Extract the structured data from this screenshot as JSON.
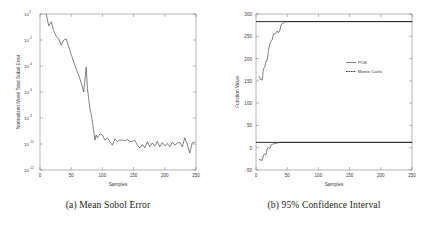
{
  "figure": {
    "subfigures": [
      {
        "id": "a",
        "caption": "(a) Mean Sobol Error"
      },
      {
        "id": "b",
        "caption": "(b) 95% Confidence Interval"
      }
    ]
  },
  "chart_data": [
    {
      "type": "line",
      "title": "",
      "caption": "(a) Mean Sobol Error",
      "xlabel": "Samples",
      "ylabel": "Normalized Mean Total Sobol Error",
      "xlim": [
        0,
        250
      ],
      "ylim": [
        1e-12,
        1
      ],
      "yscale": "log",
      "grid": false,
      "legend": null,
      "xticks": [
        0,
        50,
        100,
        150,
        200,
        250
      ],
      "xticklabels": [
        "0",
        "50",
        "100",
        "150",
        "200",
        "250"
      ],
      "yticks": [
        1,
        0.01,
        0.0001,
        1e-06,
        1e-08,
        1e-10,
        1e-12
      ],
      "yticklabels": [
        "10^0",
        "10^-2",
        "10^-4",
        "10^-6",
        "10^-8",
        "10^-10",
        "10^-12"
      ],
      "series": [
        {
          "name": "Normalized Mean Total Sobol Error",
          "x": [
            10,
            14,
            18,
            22,
            26,
            30,
            34,
            38,
            42,
            46,
            50,
            54,
            58,
            62,
            66,
            70,
            74,
            76,
            78,
            80,
            82,
            84,
            86,
            88,
            90,
            92,
            96,
            100,
            104,
            108,
            112,
            116,
            120,
            124,
            128,
            132,
            136,
            140,
            144,
            148,
            152,
            156,
            160,
            164,
            168,
            172,
            176,
            180,
            184,
            188,
            192,
            196,
            200,
            204,
            208,
            212,
            216,
            220,
            224,
            228,
            232,
            236,
            240,
            244,
            248
          ],
          "y": [
            1.0,
            0.12,
            0.25,
            0.05,
            0.02,
            0.012,
            0.004,
            0.01,
            0.012,
            0.003,
            0.0008,
            0.0002,
            6e-05,
            2e-05,
            5e-06,
            1e-06,
            8e-05,
            2e-06,
            3e-07,
            5e-08,
            2e-08,
            5e-09,
            1e-09,
            2e-10,
            5e-10,
            3e-10,
            6e-10,
            5e-10,
            2e-10,
            3e-10,
            1.5e-10,
            8e-11,
            2.5e-10,
            1.5e-10,
            2e-10,
            2e-10,
            1.8e-10,
            2.2e-10,
            1.5e-10,
            1.6e-10,
            2e-10,
            8e-11,
            5e-11,
            9e-11,
            5e-11,
            1.5e-10,
            6e-11,
            1.2e-10,
            7e-11,
            1.6e-10,
            6e-11,
            1.3e-10,
            7e-11,
            1.1e-10,
            6e-11,
            1.4e-10,
            8e-11,
            1.2e-10,
            1.3e-10,
            6e-11,
            3e-10,
            1e-10,
            2e-11,
            1.2e-10,
            1.4e-10
          ]
        }
      ]
    },
    {
      "type": "line",
      "title": "",
      "caption": "(b) 95% Confidence Interval",
      "xlabel": "Samples",
      "ylabel": "Function Value",
      "xlim": [
        0,
        250
      ],
      "ylim": [
        -50,
        300
      ],
      "yscale": "linear",
      "grid": false,
      "legend": {
        "position": "center-right",
        "entries": [
          {
            "label": "PCE",
            "style": "solid"
          },
          {
            "label": "Monte Carlo",
            "style": "dashed"
          }
        ]
      },
      "xticks": [
        0,
        50,
        100,
        150,
        200,
        250
      ],
      "xticklabels": [
        "0",
        "50",
        "100",
        "150",
        "200",
        "250"
      ],
      "yticks": [
        -50,
        0,
        50,
        100,
        150,
        200,
        250,
        300
      ],
      "yticklabels": [
        "-50",
        "0",
        "50",
        "100",
        "150",
        "200",
        "250",
        "300"
      ],
      "series": [
        {
          "name": "PCE upper bound",
          "x": [
            5,
            8,
            10,
            12,
            14,
            16,
            18,
            20,
            22,
            24,
            26,
            28,
            30,
            32,
            34,
            36,
            38,
            40,
            42,
            44,
            46,
            48,
            50,
            60,
            80,
            100,
            150,
            200,
            250
          ],
          "y": [
            160,
            152,
            152,
            178,
            180,
            195,
            196,
            218,
            232,
            240,
            242,
            255,
            255,
            258,
            262,
            258,
            262,
            275,
            278,
            280,
            282,
            283,
            283,
            283,
            283,
            283,
            283,
            283,
            283
          ]
        },
        {
          "name": "PCE lower bound",
          "x": [
            5,
            8,
            10,
            12,
            14,
            16,
            18,
            20,
            22,
            24,
            26,
            28,
            30,
            32,
            34,
            36,
            38,
            40,
            44,
            48,
            50,
            60,
            80,
            100,
            150,
            200,
            250
          ],
          "y": [
            -26,
            -28,
            -28,
            -16,
            -14,
            -16,
            -2,
            0,
            -2,
            6,
            8,
            8,
            10,
            9,
            11,
            11,
            12,
            12,
            12,
            12,
            12,
            12,
            12,
            12,
            12,
            12,
            12
          ]
        },
        {
          "name": "Monte Carlo upper bound",
          "x": [
            0,
            250
          ],
          "y": [
            283,
            283
          ]
        },
        {
          "name": "Monte Carlo lower bound",
          "x": [
            0,
            250
          ],
          "y": [
            12,
            12
          ]
        }
      ]
    }
  ]
}
